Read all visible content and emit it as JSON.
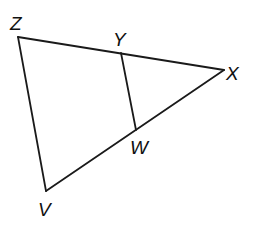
{
  "diagram": {
    "type": "geometry-triangle",
    "points": {
      "Z": {
        "x": 18,
        "y": 37,
        "label": "Z",
        "lx": 10,
        "ly": 30
      },
      "Y": {
        "x": 121,
        "y": 53,
        "label": "Y",
        "lx": 113,
        "ly": 46
      },
      "X": {
        "x": 224,
        "y": 70,
        "label": "X",
        "lx": 226,
        "ly": 80
      },
      "W": {
        "x": 136,
        "y": 130,
        "label": "W",
        "lx": 130,
        "ly": 154
      },
      "V": {
        "x": 46,
        "y": 191,
        "label": "V",
        "lx": 38,
        "ly": 216
      }
    },
    "segments": [
      {
        "from": "Z",
        "to": "X",
        "name": "side-ZX"
      },
      {
        "from": "X",
        "to": "V",
        "name": "side-XV"
      },
      {
        "from": "V",
        "to": "Z",
        "name": "side-VZ"
      },
      {
        "from": "Y",
        "to": "W",
        "name": "segment-YW"
      }
    ],
    "labels": [
      "Z",
      "Y",
      "X",
      "W",
      "V"
    ],
    "stroke_color": "#1a1a1a",
    "background": "#ffffff"
  }
}
